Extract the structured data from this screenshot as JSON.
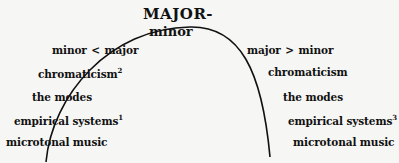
{
  "diagram": {
    "title": "MAJOR-",
    "subtitle": "minor",
    "left": [
      {
        "text": "minor",
        "relation": "<",
        "text2": "major"
      },
      {
        "text": "chromaticism",
        "sup": "2"
      },
      {
        "text": "the modes"
      },
      {
        "text": "empirical systems",
        "sup": "1"
      },
      {
        "text": "microtonal music"
      }
    ],
    "right": [
      {
        "text": "major",
        "relation": ">",
        "text2": "minor"
      },
      {
        "text": "chromaticism"
      },
      {
        "text": "the modes"
      },
      {
        "text": "empirical systems",
        "sup": "3"
      },
      {
        "text": "microtonal music"
      }
    ]
  }
}
